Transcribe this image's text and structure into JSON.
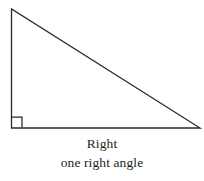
{
  "figure": {
    "name": "right-triangle-diagram",
    "background_color": "#ffffff",
    "stroke_color": "#2a2a2a",
    "stroke_width": 1.3,
    "canvas": {
      "width": 204,
      "height": 181
    },
    "shape": {
      "type": "triangle",
      "classification": "right",
      "vertices": [
        {
          "label": "apex",
          "x": 11,
          "y": 9
        },
        {
          "label": "bottom-left",
          "x": 11,
          "y": 128
        },
        {
          "label": "bottom-right",
          "x": 200,
          "y": 128
        }
      ],
      "sides": [
        {
          "name": "vertical-leg",
          "from": "apex",
          "to": "bottom-left"
        },
        {
          "name": "horizontal-leg",
          "from": "bottom-left",
          "to": "bottom-right"
        },
        {
          "name": "hypotenuse",
          "from": "apex",
          "to": "bottom-right"
        }
      ]
    },
    "right_angle_marker": {
      "name": "right-angle-square",
      "at_vertex": "bottom-left",
      "x": 12,
      "y": 117,
      "size": 10
    }
  },
  "caption": {
    "title": "Right",
    "description": "one right angle"
  }
}
